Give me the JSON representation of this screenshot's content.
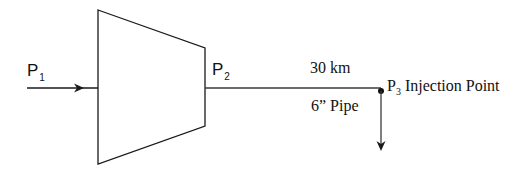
{
  "diagram": {
    "type": "compressor-pipeline-schematic",
    "colors": {
      "background": "#ffffff",
      "stroke": "#1a1a1a",
      "text": "#111111"
    },
    "inlet": {
      "label_main": "P",
      "label_sub": "1",
      "arrow_direction": "right"
    },
    "compressor": {
      "shape": "trapezoid",
      "outlet_label_main": "P",
      "outlet_label_sub": "2"
    },
    "pipe": {
      "length_label": "30 km",
      "size_label": "6” Pipe"
    },
    "injection": {
      "label_main": "P",
      "label_sub": "3",
      "label_text": "Injection Point",
      "arrow_direction": "down"
    }
  }
}
